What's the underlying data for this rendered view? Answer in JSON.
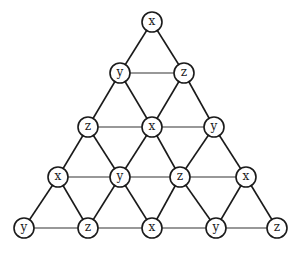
{
  "diagram": {
    "type": "triangular-lattice-graph",
    "rows": [
      [
        "x"
      ],
      [
        "y",
        "z"
      ],
      [
        "z",
        "x",
        "y"
      ],
      [
        "x",
        "y",
        "z",
        "x"
      ],
      [
        "y",
        "z",
        "x",
        "y",
        "z"
      ]
    ],
    "node_positions": [
      [
        [
          152,
          22
        ]
      ],
      [
        [
          120,
          73
        ],
        [
          184,
          73
        ]
      ],
      [
        [
          88,
          127
        ],
        [
          152,
          127
        ],
        [
          214,
          127
        ]
      ],
      [
        [
          58,
          177
        ],
        [
          120,
          177
        ],
        [
          180,
          177
        ],
        [
          246,
          177
        ]
      ],
      [
        [
          24,
          228
        ],
        [
          88,
          228
        ],
        [
          152,
          228
        ],
        [
          216,
          228
        ],
        [
          277,
          228
        ]
      ]
    ],
    "node_radius": 10,
    "colors": {
      "stroke": "#1a1a1a",
      "fill": "#ffffff",
      "label": "#222222"
    }
  }
}
